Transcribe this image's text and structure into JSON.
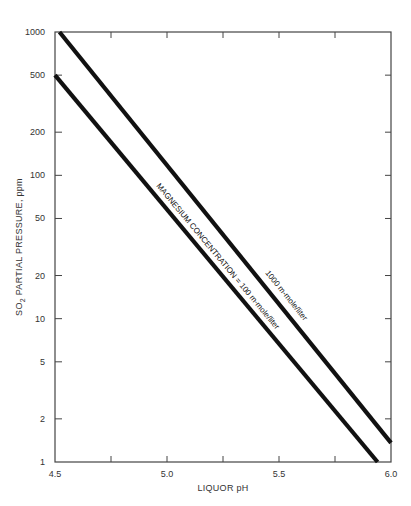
{
  "chart_data": {
    "type": "line",
    "title": "",
    "xlabel": "LIQUOR pH",
    "ylabel": "SO2 PARTIAL PRESSURE, ppm",
    "ylabel_parts": {
      "pre": "SO",
      "sub": "2",
      "post": " PARTIAL PRESSURE, ppm"
    },
    "xlim": [
      4.5,
      6.0
    ],
    "ylim": [
      1,
      1000
    ],
    "yscale": "log",
    "grid": false,
    "x_ticks": [
      {
        "value": 4.5,
        "label": "4.5"
      },
      {
        "value": 4.75,
        "label": ""
      },
      {
        "value": 5.0,
        "label": "5.0"
      },
      {
        "value": 5.25,
        "label": ""
      },
      {
        "value": 5.5,
        "label": "5.5"
      },
      {
        "value": 5.75,
        "label": ""
      },
      {
        "value": 6.0,
        "label": "6.0"
      }
    ],
    "y_ticks": [
      {
        "value": 1,
        "label": "1"
      },
      {
        "value": 2,
        "label": "2"
      },
      {
        "value": 5,
        "label": "5"
      },
      {
        "value": 10,
        "label": "10"
      },
      {
        "value": 20,
        "label": "20"
      },
      {
        "value": 50,
        "label": "50"
      },
      {
        "value": 100,
        "label": "100"
      },
      {
        "value": 200,
        "label": "200"
      },
      {
        "value": 500,
        "label": "500"
      },
      {
        "value": 1000,
        "label": "1000"
      }
    ],
    "series": [
      {
        "name": "1000 m-mole/liter",
        "label": "1000 m-mole/liter",
        "x": [
          4.52,
          6.0
        ],
        "y": [
          1000,
          1.36
        ]
      },
      {
        "name": "100 m-mole/liter",
        "label": "MAGNESIUM CONCENTRATION = 100 m-mole/liter",
        "x": [
          4.5,
          5.94
        ],
        "y": [
          500,
          1
        ]
      }
    ],
    "legend": "inline labels along lines"
  },
  "colors": {
    "line": "#111111",
    "axis": "#444444",
    "text": "#333333"
  }
}
